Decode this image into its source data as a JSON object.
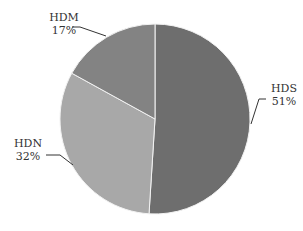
{
  "chart_data": {
    "type": "pie",
    "title": "",
    "categories": [
      "HDS",
      "HDN",
      "HDM"
    ],
    "values": [
      51,
      32,
      17
    ],
    "unit": "%",
    "colors": [
      "#6e6e6e",
      "#a8a8a8",
      "#838383"
    ],
    "labels": [
      {
        "name": "HDS",
        "value": "51%"
      },
      {
        "name": "HDN",
        "value": "32%"
      },
      {
        "name": "HDM",
        "value": "17%"
      }
    ],
    "start_angle_deg": 0,
    "direction": "clockwise",
    "legend": "none (inline leader-line labels)"
  }
}
